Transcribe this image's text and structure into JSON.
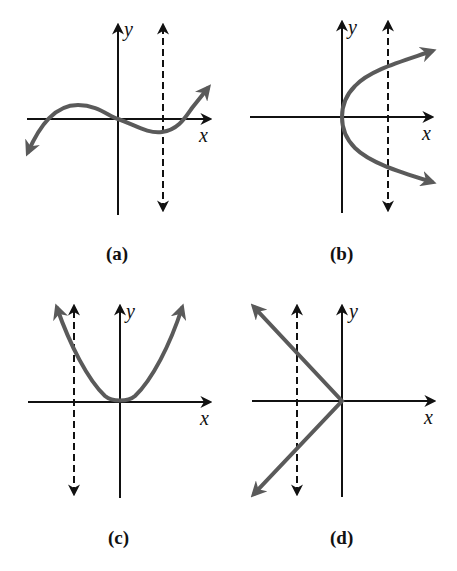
{
  "figure": {
    "panels": [
      {
        "id": "a",
        "caption": "(a)",
        "x_label": "x",
        "y_label": "y",
        "curve": "cubic",
        "vertical_line": "dashed line right of y-axis"
      },
      {
        "id": "b",
        "caption": "(b)",
        "x_label": "x",
        "y_label": "y",
        "curve": "sideways parabola opening right",
        "vertical_line": "dashed line right of y-axis"
      },
      {
        "id": "c",
        "caption": "(c)",
        "x_label": "x",
        "y_label": "y",
        "curve": "parabola opening upward",
        "vertical_line": "dashed line left of y-axis"
      },
      {
        "id": "d",
        "caption": "(d)",
        "x_label": "x",
        "y_label": "y",
        "curve": "sideways V opening left",
        "vertical_line": "dashed line left of y-axis"
      }
    ],
    "colors": {
      "axis": "#111111",
      "curve": "#5a5a5a",
      "background": "#ffffff"
    }
  }
}
